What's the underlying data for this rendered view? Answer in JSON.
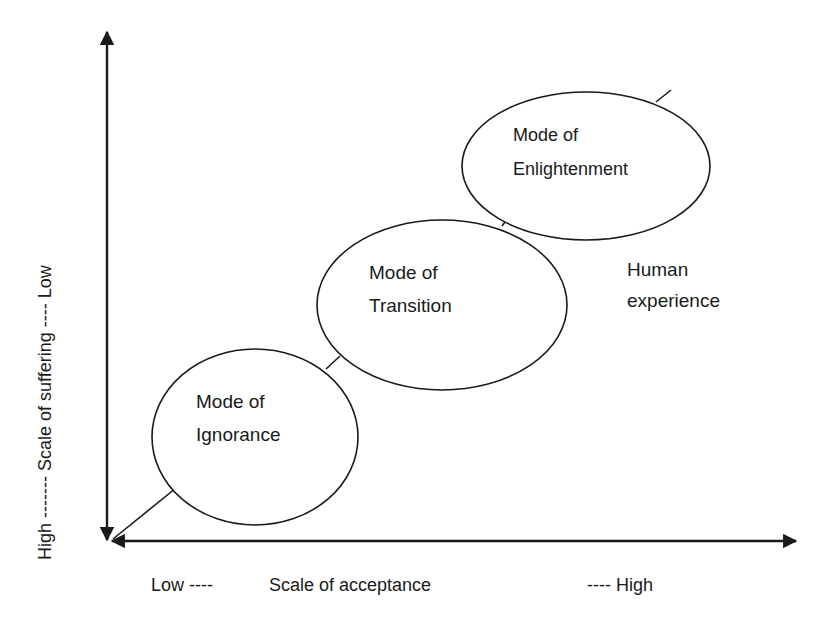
{
  "diagram": {
    "type": "conceptual-axes-with-progression",
    "y_axis": {
      "label_low_end": "High",
      "label_sep1": "-------",
      "label_title": "Scale of suffering",
      "label_sep2": "----",
      "label_high_end": "Low",
      "full_label": "High ------- Scale of suffering ---- Low"
    },
    "x_axis": {
      "label_low_end": "Low ----",
      "label_title": "Scale of acceptance",
      "label_high_end": "---- High"
    },
    "nodes": [
      {
        "id": "ignorance",
        "line1": "Mode of",
        "line2": "Ignorance"
      },
      {
        "id": "transition",
        "line1": "Mode of",
        "line2": "Transition"
      },
      {
        "id": "enlightenment",
        "line1": "Mode of",
        "line2": "Enlightenment"
      }
    ],
    "path_label": {
      "line1": "Human",
      "line2": "experience"
    },
    "colors": {
      "stroke": "#1a1a1a",
      "background": "#ffffff",
      "node_fill": "#ffffff"
    }
  }
}
